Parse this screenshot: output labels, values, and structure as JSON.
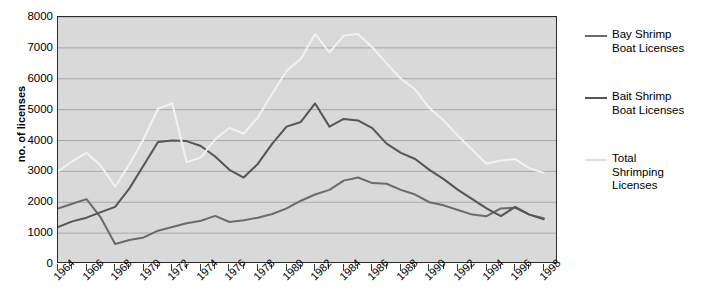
{
  "chart_data": {
    "type": "line",
    "title": "",
    "xlabel": "",
    "ylabel": "no. of licenses",
    "xlim": [
      1964,
      1999
    ],
    "ylim": [
      0,
      8000
    ],
    "ytick_values": [
      0,
      1000,
      2000,
      3000,
      4000,
      5000,
      6000,
      7000,
      8000
    ],
    "ytick_labels": [
      "0",
      "1000",
      "2000",
      "3000",
      "4000",
      "5000",
      "6000",
      "7000",
      "8000"
    ],
    "grid": "horizontal",
    "legend_position": "right",
    "x": [
      1964,
      1965,
      1966,
      1967,
      1968,
      1969,
      1970,
      1971,
      1972,
      1973,
      1974,
      1975,
      1976,
      1977,
      1978,
      1979,
      1980,
      1981,
      1982,
      1983,
      1984,
      1985,
      1986,
      1987,
      1988,
      1989,
      1990,
      1991,
      1992,
      1993,
      1994,
      1995,
      1996,
      1997,
      1998
    ],
    "xtick_labels": [
      "1964",
      "1966",
      "1968",
      "1970",
      "1972",
      "1974",
      "1976",
      "1978",
      "1980",
      "1982",
      "1984",
      "1986",
      "1988",
      "1990",
      "1992",
      "1994",
      "1996",
      "1998"
    ],
    "series": [
      {
        "name": "Bay Shrimp Boat Licenses",
        "color": "#6b6b6b",
        "width": 2,
        "values": [
          1800,
          1950,
          2100,
          1500,
          650,
          780,
          860,
          1080,
          1200,
          1320,
          1400,
          1560,
          1360,
          1420,
          1500,
          1620,
          1800,
          2050,
          2250,
          2400,
          2700,
          2800,
          2620,
          2600,
          2400,
          2250,
          2000,
          1900,
          1750,
          1600,
          1550,
          1800,
          1820,
          1600,
          1480
        ]
      },
      {
        "name": "Bait Shrimp Boat Licenses",
        "color": "#555555",
        "width": 2,
        "values": [
          1200,
          1380,
          1500,
          1680,
          1850,
          2450,
          3200,
          3950,
          4000,
          3980,
          3820,
          3480,
          3050,
          2800,
          3250,
          3900,
          4450,
          4600,
          5200,
          4450,
          4700,
          4650,
          4400,
          3900,
          3600,
          3400,
          3050,
          2750,
          2400,
          2100,
          1800,
          1550,
          1850,
          1600,
          1450
        ]
      },
      {
        "name": "Total Shrimping Licenses",
        "color": "#f2f2f2",
        "width": 2,
        "values": [
          3000,
          3330,
          3600,
          3180,
          2500,
          3230,
          4060,
          5030,
          5200,
          3300,
          3450,
          4040,
          4410,
          4220,
          4750,
          5520,
          6250,
          6650,
          7450,
          6850,
          7400,
          7450,
          7020,
          6500,
          6000,
          5650,
          5050,
          4650,
          4150,
          3700,
          3250,
          3350,
          3400,
          3100,
          2950
        ]
      }
    ]
  },
  "legend": {
    "items": [
      {
        "label": "Bay Shrimp\nBoat Licenses",
        "color": "#6b6b6b"
      },
      {
        "label": "Bait Shrimp\nBoat Licenses",
        "color": "#555555"
      },
      {
        "label": "Total\nShrimping\nLicenses",
        "color": "#e0e0e0"
      }
    ]
  },
  "colors": {
    "plot_background": "#d9d9d9",
    "frame": "#2b2b2b",
    "gridline": "#a8a8a8"
  }
}
